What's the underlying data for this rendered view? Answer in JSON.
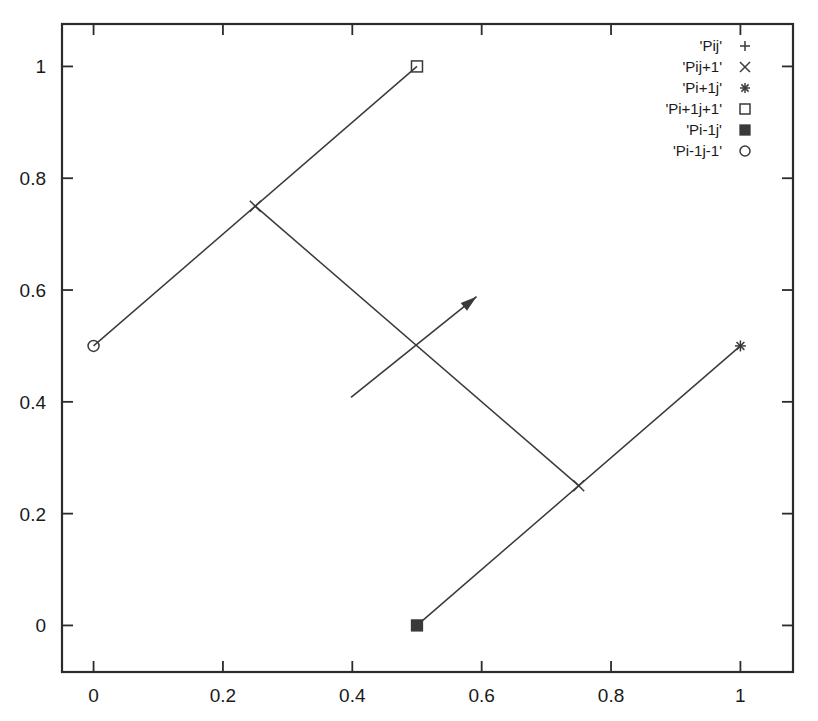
{
  "chart_data": {
    "type": "scatter",
    "title": "",
    "xlabel": "",
    "ylabel": "",
    "xlim": [
      -0.0488,
      1.0813
    ],
    "ylim": [
      -0.0833,
      1.0759
    ],
    "grid": false,
    "legend_position": "top-right",
    "x_ticks": [
      "0",
      "0.2",
      "0.4",
      "0.6",
      "0.8",
      "1"
    ],
    "x_tick_values": [
      0,
      0.2,
      0.4,
      0.6,
      0.8,
      1
    ],
    "y_ticks": [
      "0",
      "0.2",
      "0.4",
      "0.6",
      "0.8",
      "1"
    ],
    "y_tick_values": [
      0,
      0.2,
      0.4,
      0.6,
      0.8,
      1
    ],
    "series": [
      {
        "name": "'Pij'",
        "marker": "plus",
        "points": []
      },
      {
        "name": "'Pij+1'",
        "marker": "cross",
        "points": [
          [
            0.25,
            0.75
          ],
          [
            0.75,
            0.25
          ]
        ]
      },
      {
        "name": "'Pi+1j'",
        "marker": "asterisk",
        "points": [
          [
            1.0,
            0.5
          ]
        ]
      },
      {
        "name": "'Pi+1j+1'",
        "marker": "open-square",
        "points": [
          [
            0.5,
            1.0
          ]
        ]
      },
      {
        "name": "'Pi-1j'",
        "marker": "filled-square",
        "points": [
          [
            0.5,
            0.0
          ]
        ]
      },
      {
        "name": "'Pi-1j-1'",
        "marker": "open-circle",
        "points": [
          [
            0.0,
            0.5
          ]
        ]
      }
    ],
    "lines": [
      {
        "name": "line-lower-left-to-upper",
        "from": [
          0.0,
          0.5
        ],
        "to": [
          0.5,
          1.0
        ]
      },
      {
        "name": "line-bottom-to-right",
        "from": [
          0.5,
          0.0
        ],
        "to": [
          1.0,
          0.5
        ]
      },
      {
        "name": "line-cross-diagonal",
        "from": [
          0.25,
          0.75
        ],
        "to": [
          0.75,
          0.25
        ]
      }
    ],
    "arrows": [
      {
        "name": "direction-arrow",
        "from": [
          0.398,
          0.408
        ],
        "to": [
          0.592,
          0.588
        ]
      }
    ]
  },
  "legend": {
    "entries": [
      {
        "label": "'Pij'",
        "marker": "plus"
      },
      {
        "label": "'Pij+1'",
        "marker": "cross"
      },
      {
        "label": "'Pi+1j'",
        "marker": "asterisk"
      },
      {
        "label": "'Pi+1j+1'",
        "marker": "open-square"
      },
      {
        "label": "'Pi-1j'",
        "marker": "filled-square"
      },
      {
        "label": "'Pi-1j-1'",
        "marker": "open-circle"
      }
    ]
  },
  "colors": {
    "line": "#3a3a3a",
    "frame": "#2b2b2b",
    "text": "#1a1a1a",
    "background": "#ffffff"
  }
}
